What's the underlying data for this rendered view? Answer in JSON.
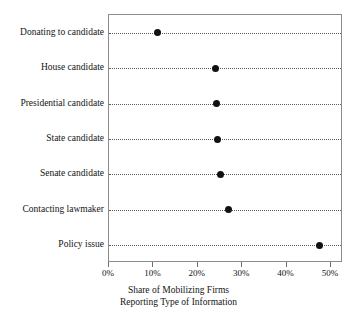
{
  "chart_data": {
    "type": "scatter",
    "subtype": "dot-plot",
    "title": "",
    "xlabel": "Share of Mobilizing Firms\nReporting Type of Information",
    "xlabel_line1": "Share of Mobilizing Firms",
    "xlabel_line2": "Reporting Type of Information",
    "ylabel": "",
    "categories": [
      "Donating to candidate",
      "House candidate",
      "Presidential candidate",
      "State candidate",
      "Senate candidate",
      "Contacting lawmaker",
      "Policy issue"
    ],
    "values": [
      11,
      24,
      24.2,
      24.5,
      25,
      27,
      47.5
    ],
    "value_unit": "percent",
    "xlim": [
      0,
      52.7
    ],
    "xticks": [
      0,
      10,
      20,
      30,
      40,
      50
    ],
    "xtick_labels": [
      "0%",
      "10%",
      "20%",
      "30%",
      "40%",
      "50%"
    ],
    "grid": "dotted-horizontal-rows",
    "legend": "none",
    "marker": "filled-circle",
    "marker_color": "#111111",
    "frame_color": "#8c8c8c",
    "guide_color": "#5a5a5a",
    "background": "#ffffff"
  }
}
